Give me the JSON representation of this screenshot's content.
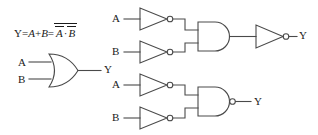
{
  "figure": {
    "stroke_color": "#4a4a4a",
    "text_color": "#1a1a1a",
    "background": "#ffffff"
  },
  "equation": {
    "lhs": "Y",
    "eq1": "=",
    "term_a": "A",
    "plus": "+",
    "term_b": "B",
    "eq2": "=",
    "not_a": "A",
    "dot": "·",
    "not_b": "B",
    "full_text": "Y=A+B=Ä̅·B̅"
  },
  "circuits": [
    {
      "id": "or-gate-circuit",
      "name": "OR gate",
      "inputs": [
        {
          "label": "A",
          "name": "or-input-a"
        },
        {
          "label": "B",
          "name": "or-input-b"
        }
      ],
      "gates": [
        {
          "type": "or",
          "name": "or-gate"
        }
      ],
      "output": {
        "label": "Y",
        "name": "or-output-y"
      }
    },
    {
      "id": "nand-equivalent-circuit",
      "name": "Inverters into AND into inverter",
      "inputs": [
        {
          "label": "A",
          "name": "top-input-a"
        },
        {
          "label": "B",
          "name": "top-input-b"
        }
      ],
      "gates": [
        {
          "type": "not",
          "name": "not-gate-a-top"
        },
        {
          "type": "not",
          "name": "not-gate-b-top"
        },
        {
          "type": "and",
          "name": "and-gate-top"
        },
        {
          "type": "not",
          "name": "not-gate-output-top"
        }
      ],
      "output": {
        "label": "Y",
        "name": "top-output-y"
      }
    },
    {
      "id": "nand-gate-circuit",
      "name": "Inverters into NAND",
      "inputs": [
        {
          "label": "A",
          "name": "bottom-input-a"
        },
        {
          "label": "B",
          "name": "bottom-input-b"
        }
      ],
      "gates": [
        {
          "type": "not",
          "name": "not-gate-a-bottom"
        },
        {
          "type": "not",
          "name": "not-gate-b-bottom"
        },
        {
          "type": "nand",
          "name": "nand-gate-bottom"
        }
      ],
      "output": {
        "label": "Y",
        "name": "bottom-output-y"
      }
    }
  ],
  "labels": {
    "or_a": "A",
    "or_b": "B",
    "or_y": "Y",
    "top_a": "A",
    "top_b": "B",
    "top_y": "Y",
    "bot_a": "A",
    "bot_b": "B",
    "bot_y": "Y"
  }
}
